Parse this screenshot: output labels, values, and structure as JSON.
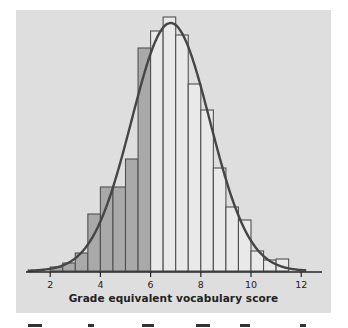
{
  "chart_data": {
    "type": "bar",
    "subtype": "histogram-with-normal-curve",
    "title": "",
    "xlabel": "Grade equivalent vocabulary score",
    "ylabel": "",
    "xlim": [
      1,
      12.5
    ],
    "x_ticks": [
      2,
      4,
      6,
      8,
      10,
      12
    ],
    "x_tick_labels": [
      "2",
      "4",
      "6",
      "8",
      "10",
      "12"
    ],
    "grid": false,
    "legend": null,
    "bin_width": 0.5,
    "bins": [
      {
        "start": 2.0,
        "height": 4,
        "shaded": true
      },
      {
        "start": 2.5,
        "height": 8,
        "shaded": true
      },
      {
        "start": 3.0,
        "height": 18,
        "shaded": true
      },
      {
        "start": 3.5,
        "height": 57,
        "shaded": true
      },
      {
        "start": 4.0,
        "height": 84,
        "shaded": true
      },
      {
        "start": 4.5,
        "height": 84,
        "shaded": true
      },
      {
        "start": 5.0,
        "height": 112,
        "shaded": true
      },
      {
        "start": 5.5,
        "height": 223,
        "shaded": true
      },
      {
        "start": 6.0,
        "height": 240,
        "shaded": false
      },
      {
        "start": 6.5,
        "height": 254,
        "shaded": false
      },
      {
        "start": 7.0,
        "height": 236,
        "shaded": false
      },
      {
        "start": 7.5,
        "height": 187,
        "shaded": false
      },
      {
        "start": 8.0,
        "height": 161,
        "shaded": false
      },
      {
        "start": 8.5,
        "height": 103,
        "shaded": false
      },
      {
        "start": 9.0,
        "height": 64,
        "shaded": false
      },
      {
        "start": 9.5,
        "height": 51,
        "shaded": false
      },
      {
        "start": 10.0,
        "height": 20,
        "shaded": false
      },
      {
        "start": 10.5,
        "height": 11,
        "shaded": false
      },
      {
        "start": 11.0,
        "height": 12,
        "shaded": false
      }
    ],
    "normal_curve": {
      "mean": 6.8,
      "sd": 1.56,
      "peak_height": 248,
      "x_from": 1.1,
      "x_to": 12.2
    },
    "colors": {
      "background": "#dedede",
      "shaded_bar": "#a9a9a9",
      "light_bar": "#e9e9e9",
      "bar_outline": "#505050",
      "curve": "#454545",
      "axis": "#222222"
    }
  },
  "axis": {
    "xlabel": "Grade equivalent vocabulary score"
  }
}
